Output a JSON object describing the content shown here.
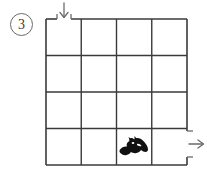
{
  "puzzle": {
    "problem_number": "3",
    "problem_number_style": "circled",
    "type": "grid-maze-path-puzzle",
    "grid": {
      "columns": 4,
      "rows": 4,
      "line_color": "#3a3a3a",
      "background_color": "#ffffff"
    },
    "entrance": {
      "label": "entrance-arrow-down",
      "direction": "down",
      "side": "top",
      "column": 1,
      "gap_in_wall": true
    },
    "exit": {
      "label": "exit-arrow-right",
      "direction": "right",
      "side": "right",
      "row": 4,
      "gap_in_wall": true
    },
    "tokens": [
      {
        "name": "bat-silhouette",
        "icon": "bat-icon",
        "color": "#111111",
        "column": 3,
        "row": 4
      }
    ]
  }
}
